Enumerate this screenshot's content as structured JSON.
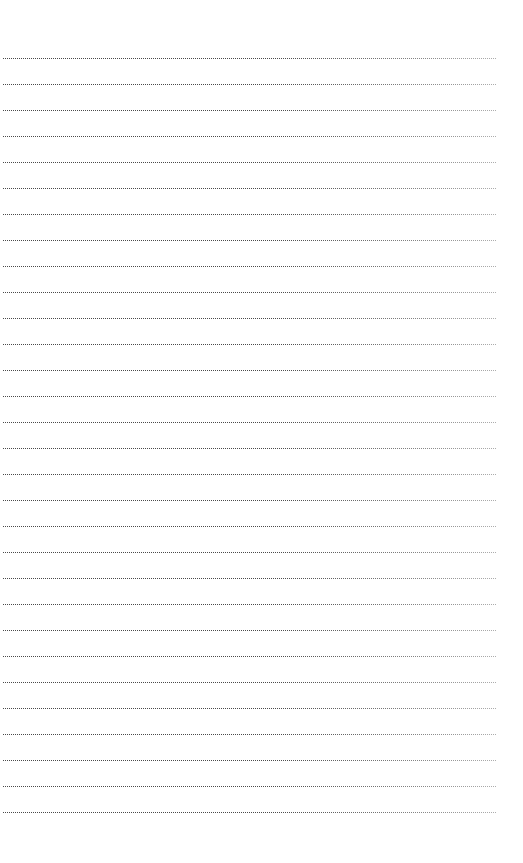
{
  "page": {
    "kind": "ruled-notepad-page",
    "background_color": "#ffffff",
    "width_px": 523,
    "height_px": 863,
    "content_text": ""
  },
  "ruling": {
    "style": "dotted",
    "line_color": "#4a4a4a",
    "line_count": 30,
    "line_spacing_px": 26,
    "first_line_y_px": 58,
    "last_line_y_px": 812,
    "line_start_x_px": 3,
    "line_end_x_px": 497,
    "line_thickness_px": 1,
    "dot_pitch_px": 2
  },
  "margins": {
    "top_margin_px": 58,
    "bottom_margin_px": 48,
    "left_margin_px": 3,
    "right_margin_px": 26
  },
  "lines": [
    {
      "index": 1,
      "y": 58,
      "text": ""
    },
    {
      "index": 2,
      "y": 84,
      "text": ""
    },
    {
      "index": 3,
      "y": 110,
      "text": ""
    },
    {
      "index": 4,
      "y": 136,
      "text": ""
    },
    {
      "index": 5,
      "y": 162,
      "text": ""
    },
    {
      "index": 6,
      "y": 188,
      "text": ""
    },
    {
      "index": 7,
      "y": 214,
      "text": ""
    },
    {
      "index": 8,
      "y": 240,
      "text": ""
    },
    {
      "index": 9,
      "y": 266,
      "text": ""
    },
    {
      "index": 10,
      "y": 292,
      "text": ""
    },
    {
      "index": 11,
      "y": 318,
      "text": ""
    },
    {
      "index": 12,
      "y": 344,
      "text": ""
    },
    {
      "index": 13,
      "y": 370,
      "text": ""
    },
    {
      "index": 14,
      "y": 396,
      "text": ""
    },
    {
      "index": 15,
      "y": 422,
      "text": ""
    },
    {
      "index": 16,
      "y": 448,
      "text": ""
    },
    {
      "index": 17,
      "y": 474,
      "text": ""
    },
    {
      "index": 18,
      "y": 500,
      "text": ""
    },
    {
      "index": 19,
      "y": 526,
      "text": ""
    },
    {
      "index": 20,
      "y": 552,
      "text": ""
    },
    {
      "index": 21,
      "y": 578,
      "text": ""
    },
    {
      "index": 22,
      "y": 604,
      "text": ""
    },
    {
      "index": 23,
      "y": 630,
      "text": ""
    },
    {
      "index": 24,
      "y": 656,
      "text": ""
    },
    {
      "index": 25,
      "y": 682,
      "text": ""
    },
    {
      "index": 26,
      "y": 708,
      "text": ""
    },
    {
      "index": 27,
      "y": 734,
      "text": ""
    },
    {
      "index": 28,
      "y": 760,
      "text": ""
    },
    {
      "index": 29,
      "y": 786,
      "text": ""
    },
    {
      "index": 30,
      "y": 812,
      "text": ""
    }
  ]
}
